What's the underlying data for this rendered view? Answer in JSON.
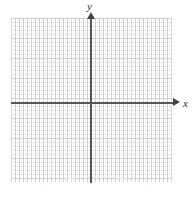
{
  "figure": {
    "title": ""
  },
  "axes": {
    "x_label": "x",
    "y_label": "y",
    "x_arrow_icon": "arrow-right-icon",
    "y_arrow_icon": "arrow-up-icon",
    "axis_color": "#555555",
    "arrow_color": "#444444"
  },
  "grid": {
    "major_line_color": "#d9d9d9",
    "minor_dot_color": "#c9c9c9",
    "background_color": "#ffffff",
    "major_spacing_px": 20,
    "minor_spacing_px": 4,
    "major_divisions_x": 8,
    "major_divisions_y": 8
  },
  "chart_data": {
    "type": "scatter",
    "title": "",
    "xlabel": "x",
    "ylabel": "y",
    "x": [],
    "y": [],
    "series": [],
    "xlim": [
      -4,
      4
    ],
    "ylim": [
      -4,
      4
    ],
    "xticks": [
      -4,
      -3,
      -2,
      -1,
      0,
      1,
      2,
      3,
      4
    ],
    "yticks": [
      -4,
      -3,
      -2,
      -1,
      0,
      1,
      2,
      3,
      4
    ],
    "xticklabels": [
      "",
      "",
      "",
      "",
      "",
      "",
      "",
      "",
      ""
    ],
    "yticklabels": [
      "",
      "",
      "",
      "",
      "",
      "",
      "",
      "",
      ""
    ],
    "grid": true,
    "legend": null,
    "annotations": []
  }
}
